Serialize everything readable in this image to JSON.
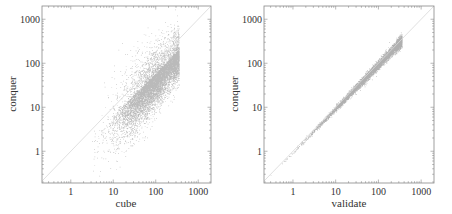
{
  "chart_data": [
    {
      "type": "scatter",
      "title": "",
      "xlabel": "cube",
      "ylabel": "conquer",
      "xscale": "log",
      "yscale": "log",
      "xlim": [
        0.21,
        2000
      ],
      "ylim": [
        0.19,
        2000
      ],
      "xticks": [
        1,
        10,
        100,
        1000
      ],
      "xtick_labels": [
        "1",
        "10",
        "100",
        "1000"
      ],
      "yticks": [
        1,
        10,
        100,
        1000
      ],
      "ytick_labels": [
        "1",
        "10",
        "100",
        "1000"
      ],
      "reference_line": "y = x (diagonal)",
      "grid": false,
      "legend": null,
      "description": "Dense point cloud; conquer mostly below cube (below diagonal), spread widening at small values",
      "distribution": {
        "n_points": 9000,
        "x_log10_range": [
          0.5,
          2.55
        ],
        "y_offset_log10_mean": -0.25,
        "y_offset_log10_spread_low": 0.55,
        "y_offset_log10_spread_high": 0.3,
        "x_log10_mode": 2.0
      },
      "sample_points": [
        {
          "x": 4,
          "y": 1
        },
        {
          "x": 10,
          "y": 5
        },
        {
          "x": 20,
          "y": 15
        },
        {
          "x": 50,
          "y": 40
        },
        {
          "x": 100,
          "y": 80
        },
        {
          "x": 200,
          "y": 120
        },
        {
          "x": 300,
          "y": 150
        },
        {
          "x": 10,
          "y": 20
        },
        {
          "x": 30,
          "y": 60
        }
      ]
    },
    {
      "type": "scatter",
      "title": "",
      "xlabel": "validate",
      "ylabel": "conquer",
      "xscale": "log",
      "yscale": "log",
      "xlim": [
        0.21,
        2000
      ],
      "ylim": [
        0.19,
        2000
      ],
      "xticks": [
        1,
        10,
        100,
        1000
      ],
      "xtick_labels": [
        "1",
        "10",
        "100",
        "1000"
      ],
      "yticks": [
        1,
        10,
        100,
        1000
      ],
      "ytick_labels": [
        "1",
        "10",
        "100",
        "1000"
      ],
      "reference_line": "y = x (diagonal)",
      "grid": false,
      "legend": null,
      "description": "Tight near-linear band along y ~ x, slight fan-out at high values",
      "distribution": {
        "n_points": 6000,
        "x_log10_range": [
          -0.55,
          2.55
        ],
        "y_offset_log10_mean": -0.03,
        "y_offset_log10_spread_low": 0.02,
        "y_offset_log10_spread_high": 0.12,
        "x_log10_mode": 2.0
      },
      "sample_points": [
        {
          "x": 0.3,
          "y": 0.28
        },
        {
          "x": 1,
          "y": 1
        },
        {
          "x": 10,
          "y": 9
        },
        {
          "x": 50,
          "y": 45
        },
        {
          "x": 100,
          "y": 90
        },
        {
          "x": 200,
          "y": 150
        },
        {
          "x": 300,
          "y": 200
        }
      ]
    }
  ],
  "colors": {
    "points": "#3a3a3a",
    "diagonal": "#d8d8d8",
    "axes": "#888888",
    "text": "#333333"
  }
}
